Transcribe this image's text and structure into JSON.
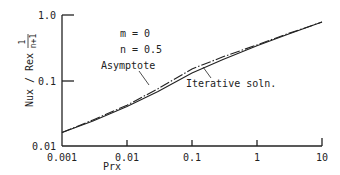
{
  "chart_data": {
    "type": "line",
    "title": "",
    "xlabel": "Prx",
    "ylabel": "Nux / Rex^(1/(n+1))",
    "ylabel_parts": {
      "main": "Nux / Rex",
      "exp_num": "1",
      "exp_den": "n+1"
    },
    "xscale": "log",
    "yscale": "log",
    "xlim": [
      0.001,
      10
    ],
    "ylim": [
      0.01,
      1.0
    ],
    "xticks": [
      "0.001",
      "0.01",
      "0.1",
      "1",
      "10"
    ],
    "yticks": [
      "0.01",
      "0.1",
      "1.0"
    ],
    "grid": false,
    "annotations": {
      "params": [
        "m = 0",
        "n = 0.5"
      ],
      "asymptote_label": "Asymptote",
      "iterative_label": "Iterative soln."
    },
    "series": [
      {
        "name": "Asymptote",
        "style": "dash-dot",
        "x": [
          0.001,
          0.003,
          0.01,
          0.03,
          0.1,
          0.3,
          1,
          3,
          10
        ],
        "y": [
          0.016,
          0.025,
          0.042,
          0.075,
          0.15,
          0.23,
          0.35,
          0.52,
          0.78
        ]
      },
      {
        "name": "Iterative soln.",
        "style": "solid",
        "x": [
          0.001,
          0.003,
          0.01,
          0.03,
          0.1,
          0.3,
          1,
          3,
          10
        ],
        "y": [
          0.016,
          0.024,
          0.04,
          0.068,
          0.13,
          0.21,
          0.34,
          0.51,
          0.78
        ]
      }
    ]
  }
}
